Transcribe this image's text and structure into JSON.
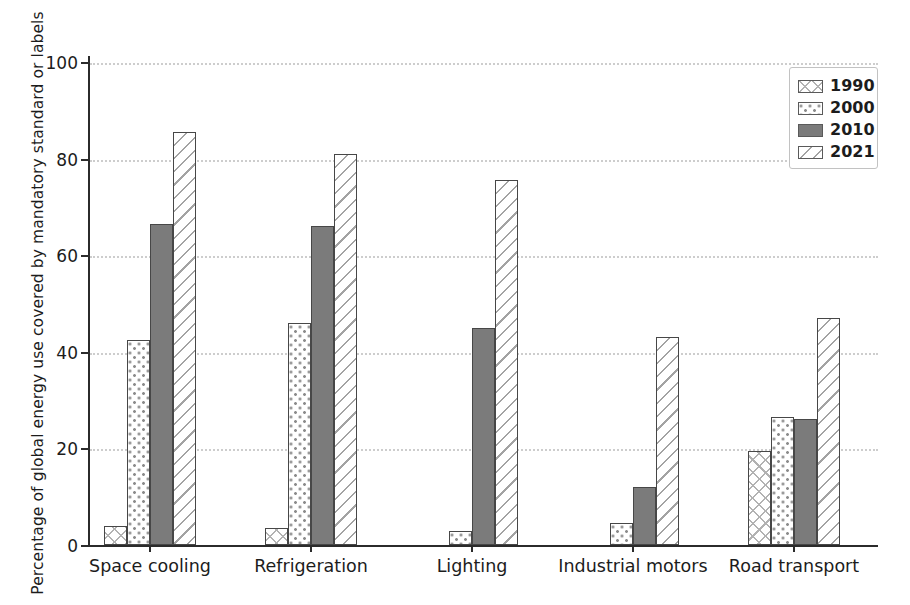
{
  "chart_data": {
    "type": "bar",
    "title": "",
    "xlabel": "",
    "ylabel": "Percentage of global energy use covered by mandatory standard or labels",
    "ylim": [
      0,
      100
    ],
    "yticks": [
      0,
      20,
      40,
      60,
      80,
      100
    ],
    "grid": "horizontal-dotted",
    "legend_position": "upper right",
    "categories": [
      "Space cooling",
      "Refrigeration",
      "Lighting",
      "Industrial motors",
      "Road transport"
    ],
    "series": [
      {
        "name": "1990",
        "hatch": "crosshatch",
        "values": [
          4,
          3.5,
          0,
          0,
          19.5
        ]
      },
      {
        "name": "2000",
        "hatch": "dots",
        "values": [
          42.5,
          46,
          3,
          4.5,
          26.5
        ]
      },
      {
        "name": "2010",
        "hatch": "solid",
        "values": [
          66.5,
          66,
          45,
          12,
          26
        ]
      },
      {
        "name": "2021",
        "hatch": "diagonal",
        "values": [
          85.5,
          81,
          75.5,
          43,
          47
        ]
      }
    ],
    "colors": {
      "solid_fill": "#7b7b7b",
      "bar_edge": "#474747",
      "hatch_gray": "#a8a8a8",
      "grid": "#cdcdcd",
      "axis": "#2b2b2b",
      "text": "#1c1c1c",
      "legend_border": "#c2c2c2",
      "background": "#ffffff"
    }
  }
}
